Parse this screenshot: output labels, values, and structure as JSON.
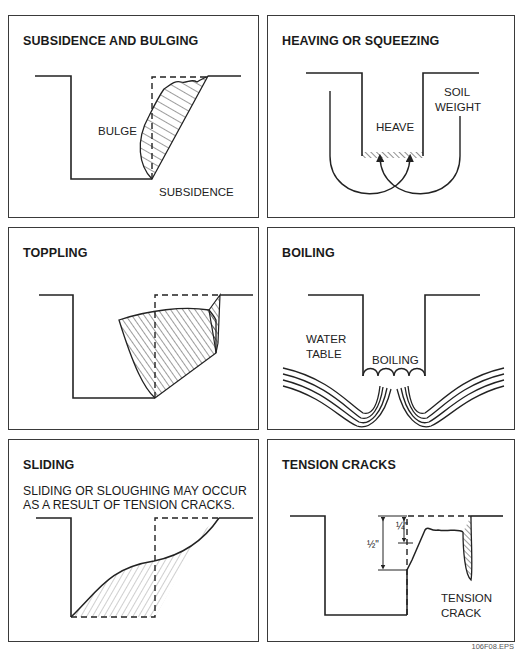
{
  "figure_id": "106F08.EPS",
  "panels": [
    {
      "title": "SUBSIDENCE AND BULGING",
      "labels": {
        "bulge": "BULGE",
        "subsidence": "SUBSIDENCE"
      }
    },
    {
      "title": "HEAVING OR SQUEEZING",
      "labels": {
        "soil_weight_1": "SOIL",
        "soil_weight_2": "WEIGHT",
        "heave": "HEAVE"
      }
    },
    {
      "title": "TOPPLING",
      "labels": {}
    },
    {
      "title": "BOILING",
      "labels": {
        "water_table_1": "WATER",
        "water_table_2": "TABLE",
        "boiling": "BOILING"
      }
    },
    {
      "title": "SLIDING",
      "subtitle_line1": "SLIDING OR SLOUGHING MAY OCCUR",
      "subtitle_line2": "AS A RESULT OF TENSION CRACKS.",
      "labels": {}
    },
    {
      "title": "TENSION CRACKS",
      "labels": {
        "quarter_inch": "¼\"",
        "half_inch": "½\"",
        "tension_crack_1": "TENSION",
        "tension_crack_2": "CRACK"
      }
    }
  ]
}
